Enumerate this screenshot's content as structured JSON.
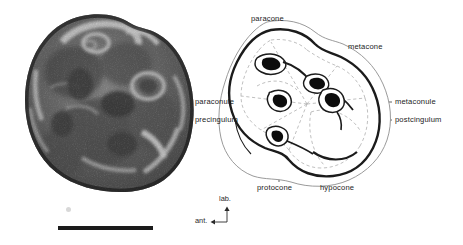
{
  "figure": {
    "type": "anatomical-figure",
    "panels": [
      "specimen-photograph",
      "schematic-diagram"
    ]
  },
  "photo": {
    "alt_name": "tooth-specimen-photograph",
    "scale_bar": {
      "label": "",
      "visible": true
    }
  },
  "diagram": {
    "labels": {
      "paracone": "paracone",
      "metacone": "metacone",
      "paraconule": "paraconule",
      "metaconule": "metaconule",
      "precingulum": "precingulum",
      "postcingulum": "postcingulum",
      "protocone": "protocone",
      "hypocone": "hypocone"
    },
    "orientation": {
      "labial": "lab.",
      "anterior": "ant."
    }
  },
  "colors": {
    "ink": "#1b1b1b",
    "outline_light": "#8f8f8f",
    "dashed": "#b0b0b0",
    "leader": "#3a3a3a",
    "background": "#ffffff"
  }
}
